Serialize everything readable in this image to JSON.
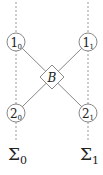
{
  "diagram": {
    "nodes": [
      {
        "id": "1_0",
        "main": "1",
        "sub": "0"
      },
      {
        "id": "1_1",
        "main": "1",
        "sub": "1"
      },
      {
        "id": "2_0",
        "main": "2",
        "sub": "0"
      },
      {
        "id": "2_1",
        "main": "2",
        "sub": "1"
      }
    ],
    "center": {
      "label": "B"
    },
    "sigmas": [
      {
        "main": "Σ",
        "sub": "0"
      },
      {
        "main": "Σ",
        "sub": "1"
      }
    ],
    "colors": {
      "line": "#888888",
      "dashed": "#999999",
      "text": "#222222"
    }
  }
}
